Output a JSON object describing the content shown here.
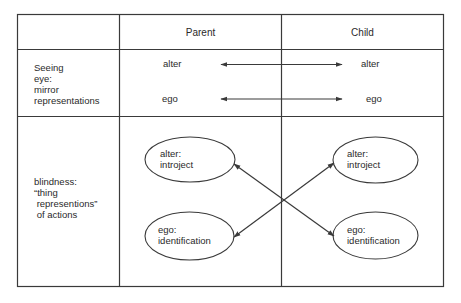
{
  "table": {
    "headers": {
      "row_label": "",
      "col1": "Parent",
      "col2": "Child"
    },
    "rows": [
      {
        "label": "Seeing\neye:\nmirror\nrepresentations",
        "parent": {
          "top": "alter",
          "bottom": "ego"
        },
        "child": {
          "top": "alter",
          "bottom": "ego"
        },
        "connections": [
          {
            "from": "parent.alter",
            "to": "child.alter",
            "type": "bidirectional-arrow"
          },
          {
            "from": "parent.ego",
            "to": "child.ego",
            "type": "bidirectional-arrow"
          }
        ]
      },
      {
        "label": "blindness:\n“thing\n representions”\n of actions",
        "parent": {
          "top": "alter:\nintroject",
          "bottom": "ego:\nidentification"
        },
        "child": {
          "top": "alter:\nintroject",
          "bottom": "ego:\nidentification"
        },
        "connections": [
          {
            "from": "parent.alter_introject",
            "to": "child.ego_identification",
            "type": "bidirectional-arrow"
          },
          {
            "from": "parent.ego_identification",
            "to": "child.alter_introject",
            "type": "bidirectional-arrow"
          }
        ]
      }
    ]
  },
  "colors": {
    "line": "#3a3a3a",
    "text": "#2a2a2a",
    "background": "#ffffff"
  }
}
